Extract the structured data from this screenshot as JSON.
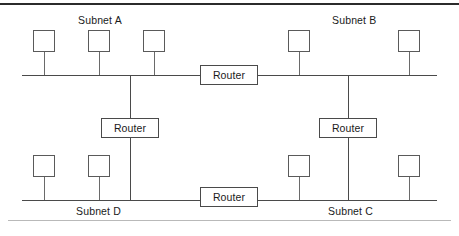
{
  "figure": {
    "width": 459,
    "height": 236,
    "line_color": "#4a4a4a",
    "rule_color_top": "#2b2b2b",
    "rule_color_bottom": "#b9b9b9"
  },
  "subnets": [
    {
      "id": "a",
      "label": "Subnet A",
      "label_x": 78,
      "label_y": 14,
      "bus_y": 75,
      "bus_x1": 22,
      "bus_x2": 200
    },
    {
      "id": "b",
      "label": "Subnet B",
      "label_x": 332,
      "label_y": 14,
      "bus_y": 75,
      "bus_x1": 258,
      "bus_x2": 437
    },
    {
      "id": "c",
      "label": "Subnet C",
      "label_x": 328,
      "label_y": 205,
      "bus_y": 200,
      "bus_x1": 258,
      "bus_x2": 437
    },
    {
      "id": "d",
      "label": "Subnet D",
      "label_x": 76,
      "label_y": 205,
      "bus_y": 200,
      "bus_x1": 22,
      "bus_x2": 200
    }
  ],
  "nodes": [
    {
      "name": "host-a1",
      "subnet": "Subnet A",
      "x": 33,
      "y": 30,
      "stem_x": 44,
      "stem_y1": 52,
      "stem_y2": 75
    },
    {
      "name": "host-a2",
      "subnet": "Subnet A",
      "x": 88,
      "y": 30,
      "stem_x": 99,
      "stem_y1": 52,
      "stem_y2": 75
    },
    {
      "name": "host-a3",
      "subnet": "Subnet A",
      "x": 143,
      "y": 30,
      "stem_x": 154,
      "stem_y1": 52,
      "stem_y2": 75
    },
    {
      "name": "host-b1",
      "subnet": "Subnet B",
      "x": 288,
      "y": 30,
      "stem_x": 299,
      "stem_y1": 52,
      "stem_y2": 75
    },
    {
      "name": "host-b2",
      "subnet": "Subnet B",
      "x": 398,
      "y": 30,
      "stem_x": 409,
      "stem_y1": 52,
      "stem_y2": 75
    },
    {
      "name": "host-d1",
      "subnet": "Subnet D",
      "x": 33,
      "y": 155,
      "stem_x": 44,
      "stem_y1": 177,
      "stem_y2": 200
    },
    {
      "name": "host-d2",
      "subnet": "Subnet D",
      "x": 88,
      "y": 155,
      "stem_x": 99,
      "stem_y1": 177,
      "stem_y2": 200
    },
    {
      "name": "host-c1",
      "subnet": "Subnet C",
      "x": 288,
      "y": 155,
      "stem_x": 299,
      "stem_y1": 177,
      "stem_y2": 200
    },
    {
      "name": "host-c2",
      "subnet": "Subnet C",
      "x": 398,
      "y": 155,
      "stem_x": 409,
      "stem_y1": 177,
      "stem_y2": 200
    }
  ],
  "routers": [
    {
      "name": "router-a-b",
      "label": "Router",
      "x": 200,
      "y": 65,
      "w": 58,
      "h": 20,
      "connects": "Subnet A to Subnet B"
    },
    {
      "name": "router-a-d",
      "label": "Router",
      "x": 101,
      "y": 118,
      "w": 58,
      "h": 20,
      "connects": "Subnet A to Subnet D"
    },
    {
      "name": "router-b-c",
      "label": "Router",
      "x": 319,
      "y": 118,
      "w": 58,
      "h": 20,
      "connects": "Subnet B to Subnet C"
    },
    {
      "name": "router-d-c",
      "label": "Router",
      "x": 200,
      "y": 187,
      "w": 58,
      "h": 20,
      "connects": "Subnet D to Subnet C"
    }
  ],
  "trunks": [
    {
      "name": "trunk-left",
      "x": 130,
      "y1": 75,
      "y2": 200
    },
    {
      "name": "trunk-right",
      "x": 348,
      "y1": 75,
      "y2": 200
    }
  ]
}
